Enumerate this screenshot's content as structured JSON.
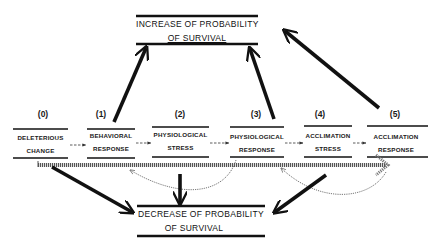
{
  "diagram": {
    "increase_box": {
      "line1": "INCREASE OF PROBABILITY",
      "line2": "OF SURVIVAL"
    },
    "decrease_box": {
      "line1": "DECREASE OF PROBABILITY",
      "line2": "OF SURVIVAL"
    },
    "stages": [
      {
        "number": "(0)",
        "line1": "DELETERIOUS",
        "line2": "CHANGE"
      },
      {
        "number": "(1)",
        "line1": "BEHAVIORAL",
        "line2": "RESPONSE"
      },
      {
        "number": "(2)",
        "line1": "PHYSIOLOGICAL",
        "line2": "STRESS"
      },
      {
        "number": "(3)",
        "line1": "PHYSIOLOGICAL",
        "line2": "RESPONSE"
      },
      {
        "number": "(4)",
        "line1": "ACCLIMATION",
        "line2": "STRESS"
      },
      {
        "number": "(5)",
        "line1": "ACCLIMATION",
        "line2": "RESPONSE"
      }
    ],
    "colors": {
      "ink": "#111111",
      "dotted": "#777777",
      "background": "#ffffff"
    }
  }
}
